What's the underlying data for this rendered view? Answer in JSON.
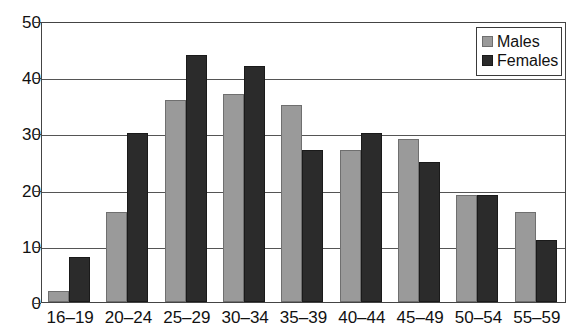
{
  "chart_data": {
    "type": "bar",
    "title": "",
    "subtitle": "",
    "xlabel": "",
    "ylabel": "",
    "ylim": [
      0,
      50
    ],
    "yticks": [
      0,
      10,
      20,
      30,
      40,
      50
    ],
    "grid": true,
    "legend_position": "top-right",
    "categories": [
      "16–19",
      "20–24",
      "25–29",
      "30–34",
      "35–39",
      "40–44",
      "45–49",
      "50–54",
      "55–59"
    ],
    "series": [
      {
        "name": "Males",
        "color": "#9a9a9a",
        "values": [
          2,
          16,
          36,
          37,
          35,
          27,
          29,
          19,
          16
        ]
      },
      {
        "name": "Females",
        "color": "#2b2b2b",
        "values": [
          8,
          30,
          44,
          42,
          27,
          30,
          25,
          19,
          11
        ]
      }
    ]
  },
  "legend": {
    "items": [
      {
        "label": "Males",
        "swatch": "males-swatch"
      },
      {
        "label": "Females",
        "swatch": "females-swatch"
      }
    ]
  }
}
